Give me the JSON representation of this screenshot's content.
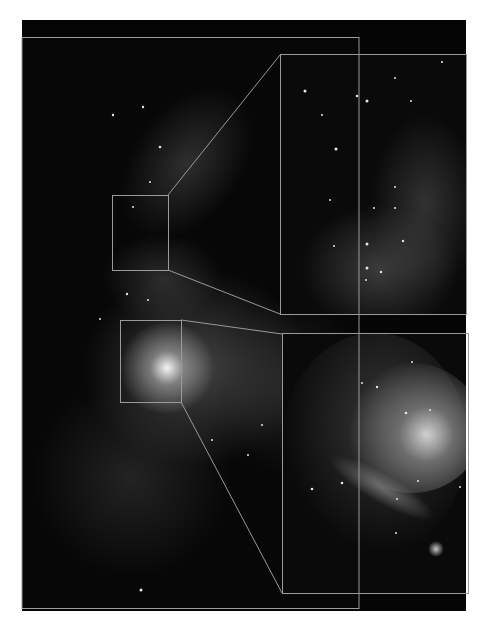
{
  "figure": {
    "background_color": "#ffffff",
    "frame_color": "#050505",
    "outline_color": "#9a9a9a",
    "main_panel": {
      "x": 22,
      "y": 37,
      "width": 337,
      "height": 571
    },
    "zoom_boxes": [
      {
        "name": "upper-region-box",
        "x": 112,
        "y": 195,
        "width": 56,
        "height": 75
      },
      {
        "name": "core-region-box",
        "x": 120,
        "y": 320,
        "width": 61,
        "height": 82
      }
    ],
    "insets": [
      {
        "name": "upper-inset",
        "x": 280,
        "y": 54,
        "width": 186,
        "height": 260
      },
      {
        "name": "core-inset",
        "x": 282,
        "y": 333,
        "width": 186,
        "height": 260
      }
    ]
  }
}
